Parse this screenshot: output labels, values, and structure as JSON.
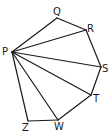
{
  "diagram": {
    "type": "polygon-triangulation",
    "vertices": [
      {
        "id": "P",
        "label": "P",
        "x": 12,
        "y": 52,
        "lx": 2,
        "ly": 55
      },
      {
        "id": "Q",
        "label": "Q",
        "x": 57,
        "y": 18,
        "lx": 53,
        "ly": 15
      },
      {
        "id": "R",
        "label": "R",
        "x": 86,
        "y": 30,
        "lx": 87,
        "ly": 32
      },
      {
        "id": "S",
        "label": "S",
        "x": 101,
        "y": 67,
        "lx": 102,
        "ly": 72
      },
      {
        "id": "T",
        "label": "T",
        "x": 91,
        "y": 95,
        "lx": 93,
        "ly": 102
      },
      {
        "id": "W",
        "label": "W",
        "x": 58,
        "y": 120,
        "lx": 54,
        "ly": 130
      },
      {
        "id": "Z",
        "label": "Z",
        "x": 28,
        "y": 121,
        "lx": 22,
        "ly": 131
      }
    ],
    "edges": [
      [
        "P",
        "Q"
      ],
      [
        "Q",
        "R"
      ],
      [
        "R",
        "S"
      ],
      [
        "S",
        "T"
      ],
      [
        "T",
        "W"
      ],
      [
        "W",
        "Z"
      ],
      [
        "Z",
        "P"
      ],
      [
        "P",
        "R"
      ],
      [
        "P",
        "S"
      ],
      [
        "P",
        "T"
      ],
      [
        "P",
        "W"
      ]
    ]
  }
}
